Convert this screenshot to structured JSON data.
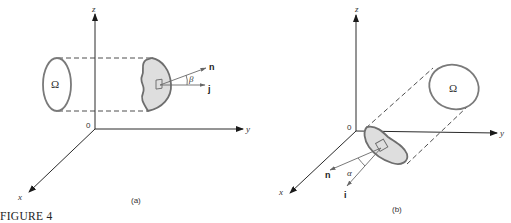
{
  "figure": {
    "caption": "FIGURE 4",
    "panels": [
      {
        "id": "a",
        "label": "(a)",
        "axes": {
          "z": "z",
          "y": "y",
          "x": "x",
          "origin": "0"
        },
        "region_label": "Ω",
        "vectors": {
          "normal": "n",
          "unit": "j"
        },
        "angle": "β"
      },
      {
        "id": "b",
        "label": "(b)",
        "axes": {
          "z": "z",
          "y": "y",
          "x": "x",
          "origin": "0"
        },
        "region_label": "Ω",
        "vectors": {
          "normal": "n",
          "unit": "i"
        },
        "angle": "α"
      }
    ]
  },
  "colors": {
    "axis": "#2a2a2a",
    "outline": "#7a7a7a",
    "surface_fill": "#dedede",
    "text": "#333333"
  }
}
